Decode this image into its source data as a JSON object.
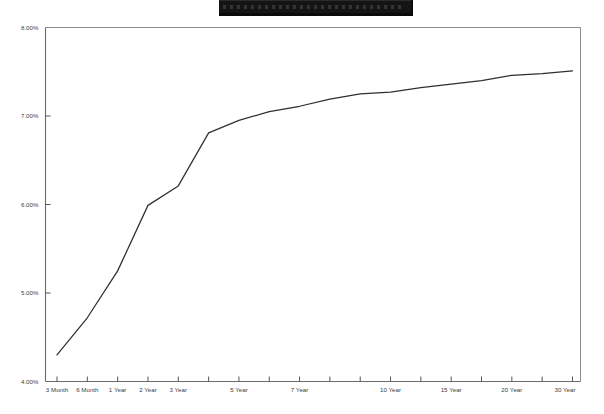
{
  "title_banner": {
    "name": "redacted-title-bar",
    "text": "",
    "redacted": true,
    "color": "#141414"
  },
  "chart_data": {
    "type": "line",
    "title": "",
    "subtitle": "",
    "xlabel": "",
    "ylabel": "",
    "grid": false,
    "legend": "none",
    "line_color": "#2f2f2f",
    "axis_color": "#6b6b6b",
    "categories": [
      "3 Month",
      "6 Month",
      "1 Year",
      "2 Year",
      "3 Year",
      "4 Year",
      "5 Year",
      "6 Year",
      "7 Year",
      "8 Year",
      "9 Year",
      "10 Year",
      "12 Year",
      "15 Year",
      "17 Year",
      "20 Year",
      "25 Year",
      "30 Year"
    ],
    "x_tick_labels": [
      "3 Month",
      "6 Month",
      "1 Year",
      "2 Year",
      "3 Year",
      "",
      "5 Year",
      "",
      "7 Year",
      "",
      "",
      "10 Year",
      "",
      "15 Year",
      "",
      "20 Year",
      "",
      "30 Year"
    ],
    "values": [
      4.3,
      4.72,
      5.25,
      5.99,
      6.21,
      6.81,
      6.95,
      7.05,
      7.11,
      7.19,
      7.25,
      7.27,
      7.32,
      7.36,
      7.4,
      7.46,
      7.48,
      7.51
    ],
    "y_tick_labels": [
      "8.00%",
      "7.00%",
      "6.00%",
      "5.00%",
      "4.00%"
    ],
    "y_tick_values": [
      8.0,
      7.0,
      6.0,
      5.0,
      4.0
    ],
    "ylim": [
      4.0,
      8.0
    ],
    "y_unit": "%",
    "series": [
      {
        "name": "yield-curve",
        "values": [
          4.3,
          4.72,
          5.25,
          5.99,
          6.21,
          6.81,
          6.95,
          7.05,
          7.11,
          7.19,
          7.25,
          7.27,
          7.32,
          7.36,
          7.4,
          7.46,
          7.48,
          7.51
        ]
      }
    ]
  }
}
